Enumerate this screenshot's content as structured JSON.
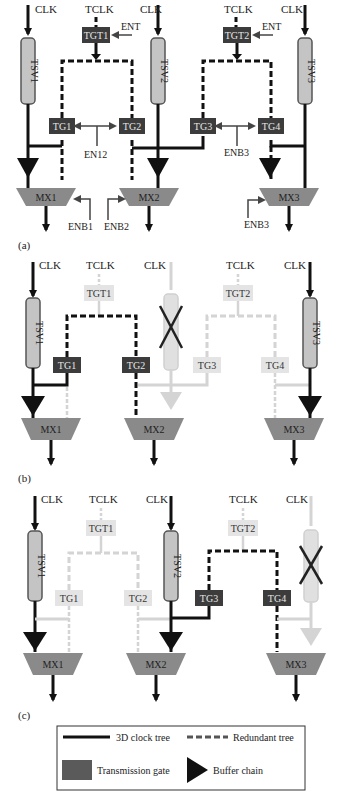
{
  "colors": {
    "clock_line": "#111111",
    "gate_dark": "#3c3c3c",
    "gate_text_dark": "#e6e6e6",
    "gate_light": "#e4e4e4",
    "mux_fill": "#8a8a8a",
    "tsv_fill": "#c4c4c4",
    "faded": "#d4d4d4",
    "cross": "#222222"
  },
  "panel_a": {
    "label": "(a)",
    "clk1": "CLK",
    "clk2": "CLK",
    "clk3": "CLK",
    "tclk1": "TCLK",
    "tclk2": "TCLK",
    "tsv1": "TSV1",
    "tsv2": "TSV2",
    "tsv3": "TSV3",
    "tgt1": "TGT1",
    "tgt2": "TGT2",
    "ent1": "ENT",
    "ent2": "ENT",
    "tg1": "TG1",
    "tg2": "TG2",
    "tg3": "TG3",
    "tg4": "TG4",
    "en12": "EN12",
    "enb3_top": "ENB3",
    "mx1": "MX1",
    "mx2": "MX2",
    "mx3": "MX3",
    "enb1": "ENB1",
    "enb2": "ENB2",
    "enb3": "ENB3"
  },
  "panel_b": {
    "label": "(b)",
    "clk1": "CLK",
    "clk2": "CLK",
    "clk3": "CLK",
    "tclk1": "TCLK",
    "tclk2": "TCLK",
    "tsv1": "TSV1",
    "tsv3": "TSV3",
    "tgt1": "TGT1",
    "tgt2": "TGT2",
    "tg1": "TG1",
    "tg2": "TG2",
    "tg3": "TG3",
    "tg4": "TG4",
    "mx1": "MX1",
    "mx2": "MX2",
    "mx3": "MX3",
    "failed_tsv": "TSV2"
  },
  "panel_c": {
    "label": "(c)",
    "clk1": "CLK",
    "clk2": "CLK",
    "clk3": "CLK",
    "tclk1": "TCLK",
    "tclk2": "TCLK",
    "tsv1": "TSV1",
    "tsv2": "TSV2",
    "tgt1": "TGT1",
    "tgt2": "TGT2",
    "tg1": "TG1",
    "tg2": "TG2",
    "tg3": "TG3",
    "tg4": "TG4",
    "mx1": "MX1",
    "mx2": "MX2",
    "mx3": "MX3",
    "failed_tsv": "TSV3"
  },
  "legend": {
    "clock_tree": "3D clock tree",
    "redundant_tree": "Redundant tree",
    "transmission_gate": "Transmission gate",
    "buffer_chain": "Buffer chain"
  }
}
